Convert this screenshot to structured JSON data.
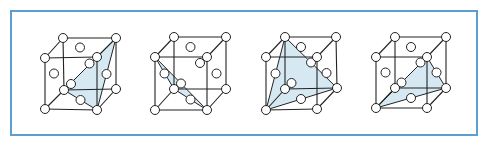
{
  "figure": {
    "colors": {
      "frame": "#5b9fd2",
      "edge": "#222222",
      "plane": "#d6e9f3",
      "atom_fill": "#ffffff"
    },
    "atom_radius": 4.5,
    "cubes": [
      {
        "id": "cube-1",
        "vertices": {
          "BTL": [
            63,
            38
          ],
          "BTR": [
            116,
            38
          ],
          "FTL": [
            45,
            58
          ],
          "FTR": [
            97,
            57
          ],
          "BBL": [
            64,
            90
          ],
          "BBR": [
            116,
            89
          ],
          "FBL": [
            45,
            109
          ],
          "FBR": [
            97,
            110
          ]
        },
        "plane": [
          "BTR",
          "BBL",
          "FBR"
        ]
      },
      {
        "id": "cube-2",
        "vertices": {
          "BTL": [
            174,
            37
          ],
          "BTR": [
            226,
            37
          ],
          "FTL": [
            155,
            57
          ],
          "FTR": [
            207,
            57
          ],
          "BBL": [
            174,
            89
          ],
          "BBR": [
            226,
            89
          ],
          "FBL": [
            155,
            110
          ],
          "FBR": [
            207,
            110
          ]
        },
        "plane": [
          "FTL",
          "BBL",
          "FBR"
        ]
      },
      {
        "id": "cube-3",
        "vertices": {
          "BTL": [
            285,
            37
          ],
          "BTR": [
            336,
            37
          ],
          "FTL": [
            266,
            57
          ],
          "FTR": [
            317,
            57
          ],
          "BBL": [
            285,
            89
          ],
          "BBR": [
            337,
            88
          ],
          "FBL": [
            266,
            110
          ],
          "FBR": [
            317,
            109
          ]
        },
        "plane": [
          "BTL",
          "FBL",
          "BBR"
        ]
      },
      {
        "id": "cube-4",
        "vertices": {
          "BTL": [
            395,
            37
          ],
          "BTR": [
            446,
            37
          ],
          "FTL": [
            376,
            57
          ],
          "FTR": [
            427,
            57
          ],
          "BBL": [
            395,
            88
          ],
          "BBR": [
            446,
            88
          ],
          "FBL": [
            376,
            108
          ],
          "FBR": [
            427,
            108
          ]
        },
        "plane": [
          "FTR",
          "FBL",
          "BBR"
        ]
      }
    ]
  }
}
